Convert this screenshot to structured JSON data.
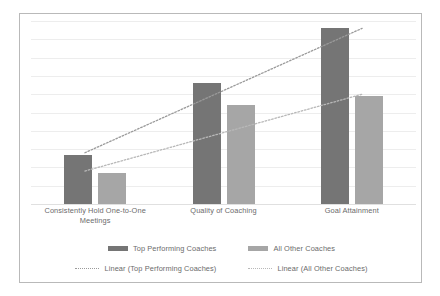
{
  "chart_data": {
    "type": "bar",
    "title": "",
    "xlabel": "",
    "ylabel": "",
    "ylim": [
      0,
      100
    ],
    "grid": true,
    "gridline_count": 10,
    "legend_position": "bottom",
    "categories": [
      "Consistently Hold One-to-One Meetings",
      "Quality of Coaching",
      "Goal Attainment"
    ],
    "category_lines": [
      [
        "Consistently Hold One-to-One",
        "Meetings"
      ],
      [
        "Quality of Coaching"
      ],
      [
        "Goal Attainment"
      ]
    ],
    "series": [
      {
        "name": "Top Performing Coaches",
        "color": "#757575",
        "values": [
          27,
          66,
          96
        ]
      },
      {
        "name": "All Other Coaches",
        "color": "#a6a6a6",
        "values": [
          17,
          54,
          59
        ]
      }
    ],
    "trendlines": [
      {
        "name": "Linear (Top Performing Coaches)",
        "style": "dotted",
        "color": "#9a9a9a",
        "x": [
          0.14,
          0.86
        ],
        "y": [
          28,
          96
        ]
      },
      {
        "name": "Linear (All Other Coaches)",
        "style": "dotted",
        "color": "#b8b8b8",
        "x": [
          0.14,
          0.86
        ],
        "y": [
          18,
          60
        ]
      }
    ]
  },
  "legend": {
    "row1": [
      {
        "label": "Top Performing Coaches",
        "marker": "solid-swatch",
        "color": "#757575"
      },
      {
        "label": "All Other Coaches",
        "marker": "solid-swatch",
        "color": "#a6a6a6"
      }
    ],
    "row2": [
      {
        "label": "Linear (Top Performing Coaches)",
        "marker": "dotted-line",
        "color": "#9a9a9a"
      },
      {
        "label": "Linear (All Other Coaches)",
        "marker": "dotted-line",
        "color": "#b8b8b8"
      }
    ]
  }
}
